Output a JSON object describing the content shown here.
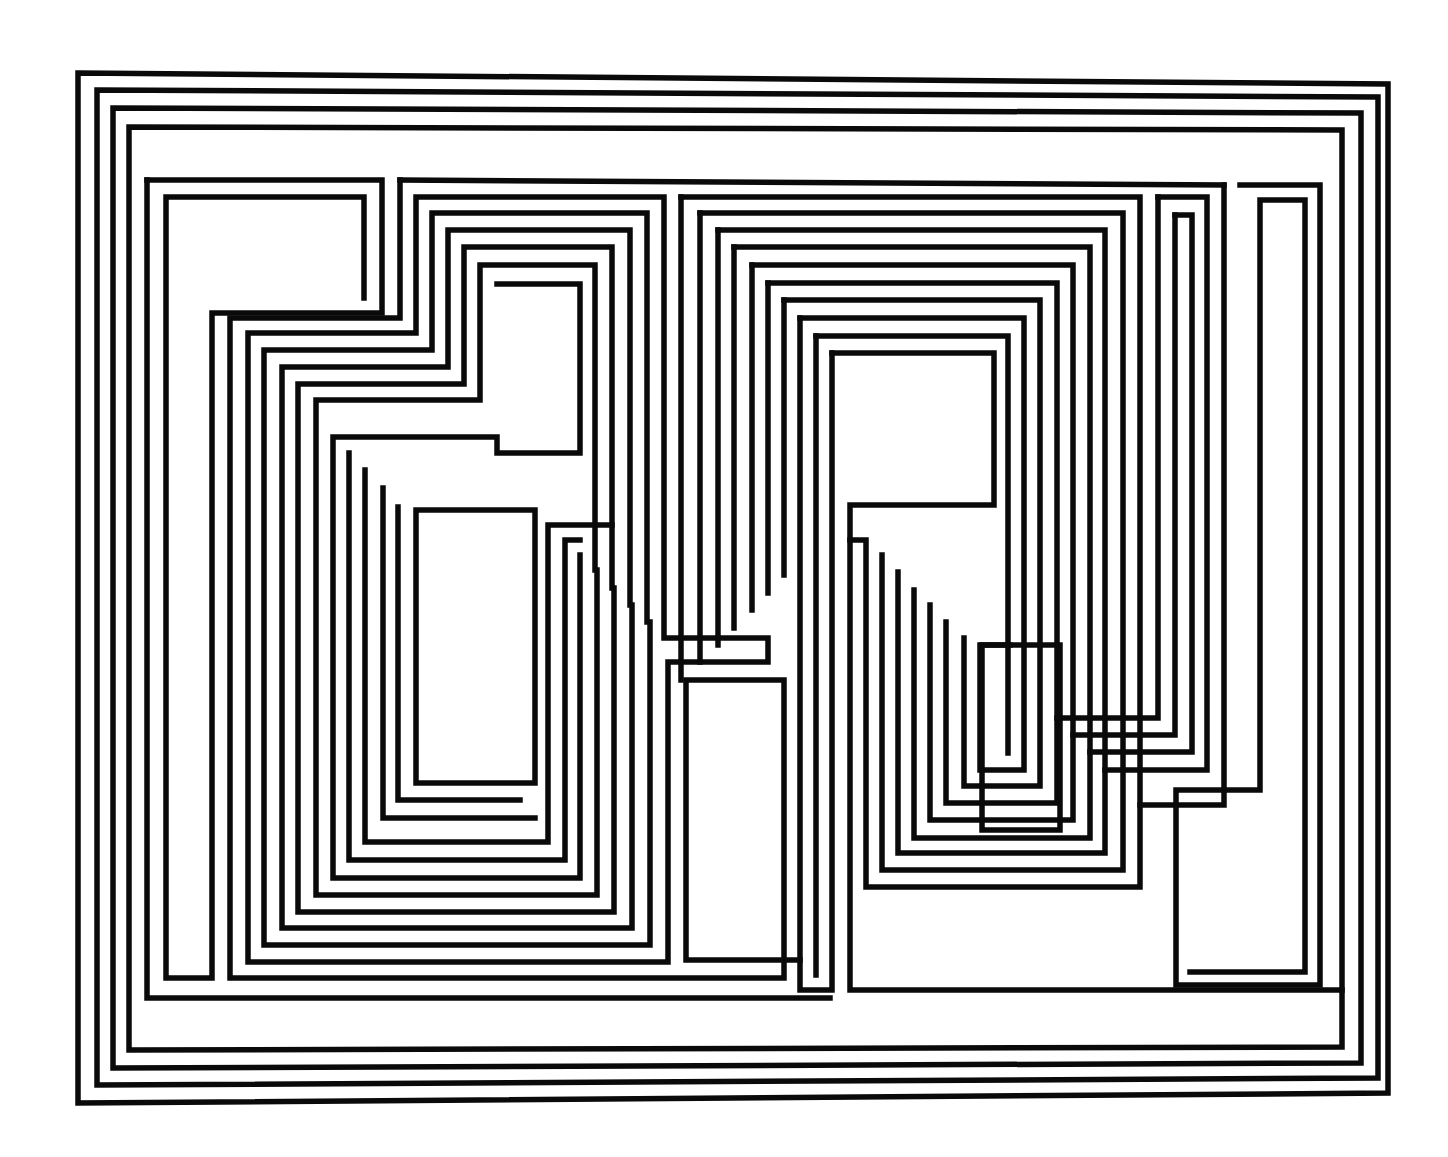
{
  "artwork": {
    "description": "Abstract geometric line composition of nested rectilinear black paths on white",
    "colors": {
      "background": "#ffffff",
      "stroke": "#0a0a0a"
    },
    "stroke_width": 5.5,
    "outer_frames": [
      [
        [
          78,
          73
        ],
        [
          1388,
          84
        ],
        [
          1388,
          1093
        ],
        [
          78,
          1103
        ],
        [
          78,
          73
        ]
      ],
      [
        [
          97,
          90
        ],
        [
          1378,
          97
        ],
        [
          1378,
          1078
        ],
        [
          97,
          1085
        ],
        [
          97,
          90
        ]
      ],
      [
        [
          113,
          108
        ],
        [
          1361,
          113
        ],
        [
          1361,
          1063
        ],
        [
          113,
          1068
        ],
        [
          113,
          108
        ]
      ],
      [
        [
          129,
          127
        ],
        [
          1342,
          130
        ],
        [
          1342,
          1047
        ],
        [
          129,
          1050
        ],
        [
          129,
          127
        ]
      ]
    ],
    "left_group": [
      [
        [
          147,
          180
        ],
        [
          382,
          180
        ],
        [
          382,
          313
        ],
        [
          232,
          313
        ],
        [
          232,
          978
        ],
        [
          147,
          978
        ],
        [
          147,
          180
        ]
      ],
      [
        [
          166,
          197
        ],
        [
          364,
          197
        ],
        [
          364,
          298
        ],
        [
          212,
          298
        ],
        [
          212,
          978
        ],
        [
          166,
          978
        ],
        [
          166,
          197
        ]
      ]
    ],
    "left_steps": [
      [
        [
          400,
          180
        ],
        [
          400,
          318
        ],
        [
          232,
          318
        ],
        [
          232,
          978
        ],
        [
          784,
          978
        ],
        [
          784,
          680
        ],
        [
          686,
          680
        ],
        [
          686,
          960
        ]
      ],
      [
        [
          416,
          197
        ],
        [
          416,
          333
        ],
        [
          250,
          333
        ],
        [
          250,
          962
        ],
        [
          768,
          962
        ]
      ],
      [
        [
          432,
          213
        ],
        [
          432,
          350
        ],
        [
          268,
          350
        ],
        [
          268,
          945
        ],
        [
          752,
          945
        ]
      ],
      [
        [
          448,
          230
        ],
        [
          448,
          367
        ],
        [
          284,
          367
        ],
        [
          284,
          928
        ],
        [
          734,
          928
        ]
      ],
      [
        [
          464,
          247
        ],
        [
          464,
          384
        ],
        [
          300,
          384
        ],
        [
          300,
          912
        ],
        [
          718,
          912
        ]
      ],
      [
        [
          480,
          265
        ],
        [
          480,
          400
        ],
        [
          316,
          400
        ],
        [
          316,
          895
        ],
        [
          702,
          895
        ]
      ],
      [
        [
          497,
          284
        ],
        [
          497,
          437
        ],
        [
          333,
          437
        ],
        [
          333,
          878
        ],
        [
          686,
          878
        ]
      ]
    ],
    "left_inner_boxes": [
      [
        [
          499,
          284
        ],
        [
          580,
          284
        ],
        [
          580,
          453
        ],
        [
          349,
          453
        ],
        [
          349,
          860
        ]
      ],
      [
        [
          595,
          265
        ],
        [
          595,
          470
        ],
        [
          365,
          470
        ],
        [
          365,
          842
        ]
      ],
      [
        [
          612,
          247
        ],
        [
          612,
          488
        ],
        [
          383,
          488
        ],
        [
          383,
          818
        ]
      ],
      [
        [
          630,
          230
        ],
        [
          630,
          507
        ],
        [
          398,
          507
        ],
        [
          398,
          800
        ]
      ],
      [
        [
          416,
          510
        ],
        [
          535,
          510
        ],
        [
          535,
          783
        ],
        [
          416,
          783
        ],
        [
          416,
          510
        ]
      ]
    ],
    "center_group": [
      [
        [
          681,
          197
        ],
        [
          1140,
          197
        ],
        [
          1140,
          887
        ]
      ],
      [
        [
          700,
          213
        ],
        [
          1123,
          213
        ],
        [
          1123,
          870
        ]
      ],
      [
        [
          718,
          230
        ],
        [
          1105,
          230
        ],
        [
          1105,
          853
        ]
      ],
      [
        [
          734,
          247
        ],
        [
          1090,
          247
        ],
        [
          1090,
          838
        ]
      ],
      [
        [
          752,
          265
        ],
        [
          1073,
          265
        ],
        [
          1073,
          820
        ]
      ],
      [
        [
          768,
          283
        ],
        [
          1057,
          283
        ],
        [
          1057,
          803
        ]
      ],
      [
        [
          784,
          300
        ],
        [
          1040,
          300
        ],
        [
          1040,
          786
        ]
      ],
      [
        [
          800,
          318
        ],
        [
          1024,
          318
        ],
        [
          1024,
          770
        ]
      ],
      [
        [
          816,
          336
        ],
        [
          1008,
          336
        ],
        [
          1008,
          753
        ]
      ],
      [
        [
          832,
          353
        ],
        [
          994,
          353
        ],
        [
          994,
          505
        ],
        [
          850,
          505
        ],
        [
          850,
          990
        ],
        [
          1342,
          990
        ]
      ]
    ],
    "right_group": [
      [
        [
          1240,
          185
        ],
        [
          1320,
          185
        ],
        [
          1320,
          985
        ],
        [
          1176,
          985
        ],
        [
          1176,
          790
        ],
        [
          1260,
          790
        ],
        [
          1260,
          200
        ],
        [
          1305,
          200
        ],
        [
          1305,
          972
        ]
      ],
      [
        [
          1158,
          197
        ],
        [
          1207,
          197
        ],
        [
          1207,
          770
        ],
        [
          1158,
          770
        ]
      ],
      [
        [
          1175,
          215
        ],
        [
          1192,
          215
        ],
        [
          1192,
          752
        ]
      ]
    ]
  }
}
